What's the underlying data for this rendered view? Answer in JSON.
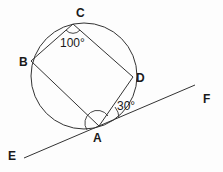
{
  "diagram": {
    "type": "geometry-circle-inscribed-quadrilateral-tangent",
    "stroke_color": "#333333",
    "background": "#fdfdfd",
    "points": {
      "A": {
        "label": "A",
        "x": 99,
        "y": 126
      },
      "B": {
        "label": "B",
        "x": 31,
        "y": 61
      },
      "C": {
        "label": "C",
        "x": 73,
        "y": 24
      },
      "D": {
        "label": "D",
        "x": 133,
        "y": 77
      },
      "E": {
        "label": "E"
      },
      "F": {
        "label": "F"
      }
    },
    "circle": {
      "cx": 84,
      "cy": 76,
      "r": 53
    },
    "tangent_line": {
      "from": "E",
      "to": "F",
      "touches": "A"
    },
    "angles": {
      "C": {
        "label": "100°",
        "vertex": "C",
        "between": [
          "B",
          "D"
        ]
      },
      "DAF": {
        "label": "30°",
        "vertex": "A",
        "between": [
          "D",
          "F"
        ]
      },
      "BAE_marked": {
        "label": "",
        "vertex": "A",
        "between": [
          "B",
          "D"
        ],
        "note": "unknown angle marked with arc"
      }
    }
  }
}
